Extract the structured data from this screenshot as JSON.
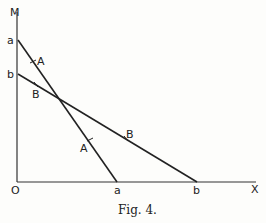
{
  "figure": {
    "caption": "Fig. 4.",
    "axes": {
      "y_label": "M",
      "x_label": "X",
      "origin_label": "O"
    },
    "lines": [
      {
        "name": "a",
        "y_intercept_label": "a",
        "x_intercept_label": "a",
        "markers": [
          "A",
          "A"
        ]
      },
      {
        "name": "b",
        "y_intercept_label": "b",
        "x_intercept_label": "b",
        "markers": [
          "B",
          "B"
        ]
      }
    ]
  }
}
